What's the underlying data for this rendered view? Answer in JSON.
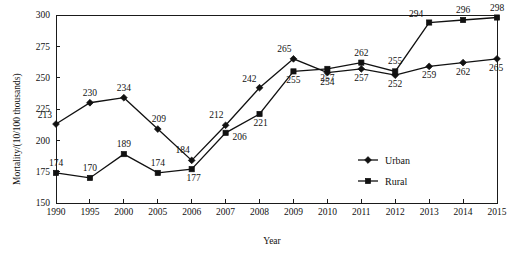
{
  "chart_data": {
    "type": "line",
    "title": "",
    "xlabel": "Year",
    "ylabel": "Mortality/(10/100 thousands)",
    "categories": [
      "1990",
      "1995",
      "2000",
      "2005",
      "2006",
      "2007",
      "2008",
      "2009",
      "2010",
      "2011",
      "2012",
      "2013",
      "2014",
      "2015"
    ],
    "xlim": [
      0,
      13
    ],
    "ylim": [
      150,
      300
    ],
    "yticks": [
      150,
      175,
      200,
      225,
      250,
      275,
      300
    ],
    "ytick_labels": [
      "150",
      "175",
      "200",
      "225",
      "250",
      "275",
      "300"
    ],
    "grid": false,
    "legend_position": "center-right-inside",
    "series": [
      {
        "name": "Urban",
        "marker": "diamond",
        "values": [
          213,
          230,
          234,
          209,
          184,
          212,
          242,
          265,
          254,
          257,
          252,
          259,
          262,
          265
        ],
        "labels": [
          "213",
          "230",
          "234",
          "209",
          "184",
          "212",
          "242",
          "265",
          "254",
          "257",
          "252",
          "259",
          "262",
          "265"
        ]
      },
      {
        "name": "Rural",
        "marker": "square",
        "values": [
          174,
          170,
          189,
          174,
          177,
          206,
          221,
          255,
          257,
          262,
          255,
          294,
          296,
          298
        ],
        "labels": [
          "174",
          "170",
          "189",
          "174",
          "177",
          "206",
          "221",
          "255",
          "257",
          "262",
          "255",
          "294",
          "296",
          "298"
        ]
      }
    ]
  },
  "legend": {
    "entries": [
      {
        "label": "Urban",
        "marker": "diamond"
      },
      {
        "label": "Rural",
        "marker": "square"
      }
    ]
  },
  "colors": {
    "ink": "#111111",
    "background": "#ffffff"
  }
}
